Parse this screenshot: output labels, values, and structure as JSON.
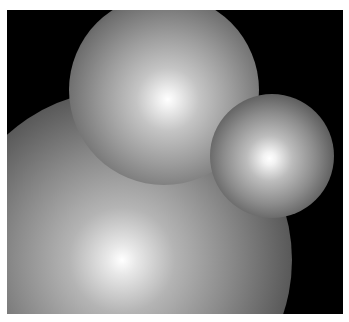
{
  "image": {
    "description": "Three softly shaded glowing spheres on a black background",
    "background_color": "#000000",
    "border_color": "#ffffff",
    "spheres": [
      {
        "name": "top",
        "center": [
          160,
          88
        ],
        "radius": 90
      },
      {
        "name": "right",
        "center": [
          268,
          155
        ],
        "radius": 58
      },
      {
        "name": "bottom-left",
        "center": [
          122,
          255
        ],
        "radius": 165
      }
    ]
  }
}
